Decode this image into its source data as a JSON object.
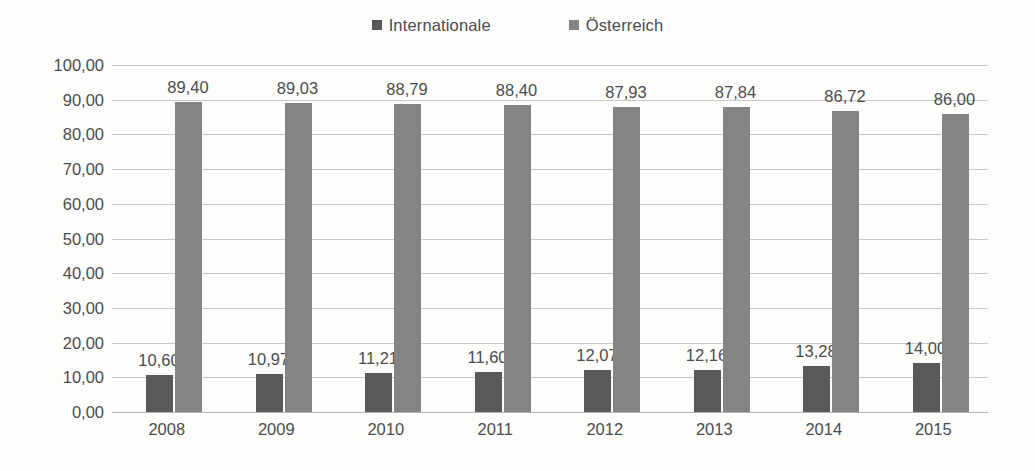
{
  "chart_data": {
    "type": "bar",
    "title": "",
    "subtitle": "",
    "xlabel": "",
    "ylabel": "",
    "categories": [
      "2008",
      "2009",
      "2010",
      "2011",
      "2012",
      "2013",
      "2014",
      "2015"
    ],
    "series": [
      {
        "name": "Internationale",
        "color": "#59595b",
        "values": [
          10.6,
          10.97,
          11.21,
          11.6,
          12.07,
          12.16,
          13.28,
          14.0
        ],
        "labels": [
          "10,60",
          "10,97",
          "11,21",
          "11,60",
          "12,07",
          "12,16",
          "13,28",
          "14,00"
        ]
      },
      {
        "name": "Österreich",
        "color": "#848484",
        "values": [
          89.4,
          89.03,
          88.79,
          88.4,
          87.93,
          87.84,
          86.72,
          86.0
        ],
        "labels": [
          "89,40",
          "89,03",
          "88,79",
          "88,40",
          "87,93",
          "87,84",
          "86,72",
          "86,00"
        ]
      }
    ],
    "ylim": [
      0,
      100
    ],
    "ytick_values": [
      0,
      10,
      20,
      30,
      40,
      50,
      60,
      70,
      80,
      90,
      100
    ],
    "ytick_labels": [
      "0,00",
      "10,00",
      "20,00",
      "30,00",
      "40,00",
      "50,00",
      "60,00",
      "70,00",
      "80,00",
      "90,00",
      "100,00"
    ],
    "grid": true,
    "legend_position": "top-center",
    "data_labels": true,
    "decimal_separator": ","
  },
  "legend": {
    "entries": [
      {
        "label": "Internationale",
        "color": "#59595b",
        "marker": "square-swatch-icon"
      },
      {
        "label": "Österreich",
        "color": "#848484",
        "marker": "square-swatch-icon"
      }
    ]
  }
}
